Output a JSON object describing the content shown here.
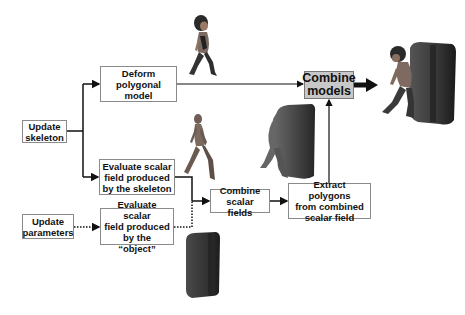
{
  "diagram": {
    "nodes": {
      "update_skeleton": "Update\nskeleton",
      "deform_polygonal_model": "Deform\npolygonal\nmodel",
      "evaluate_skeleton_field": "Evaluate scalar\nfield produced\nby the skeleton",
      "update_parameters": "Update\nparameters",
      "evaluate_object_field": "Evaluate scalar\nfield produced\nby the “object”",
      "combine_scalar_fields": "Combine\nscalar fields",
      "extract_polygons": "Extract polygons\nfrom combined\nscalar field",
      "combine_models": "Combine\nmodels"
    },
    "edges": [
      {
        "from": "update_skeleton",
        "to": "deform_polygonal_model",
        "style": "solid"
      },
      {
        "from": "update_skeleton",
        "to": "evaluate_skeleton_field",
        "style": "solid"
      },
      {
        "from": "update_parameters",
        "to": "evaluate_object_field",
        "style": "dotted"
      },
      {
        "from": "evaluate_skeleton_field",
        "to": "combine_scalar_fields",
        "style": "solid"
      },
      {
        "from": "evaluate_object_field",
        "to": "combine_scalar_fields",
        "style": "dotted"
      },
      {
        "from": "combine_scalar_fields",
        "to": "extract_polygons",
        "style": "solid"
      },
      {
        "from": "extract_polygons",
        "to": "combine_models",
        "style": "solid"
      },
      {
        "from": "deform_polygonal_model",
        "to": "combine_models",
        "style": "solid"
      },
      {
        "from": "combine_models",
        "to": "final_result",
        "style": "thick"
      }
    ],
    "images": {
      "deformed_character": "character-walking-image",
      "skeleton_field": "skeleton-implicit-surface-image",
      "object_field": "box-object-image",
      "combined_field": "blended-implicit-surface-image",
      "final_result": "character-colliding-with-box-image"
    },
    "colors": {
      "line": "#111111",
      "box_border": "#8a8a8a",
      "combine_models_fill": "#c8c8c8"
    }
  }
}
